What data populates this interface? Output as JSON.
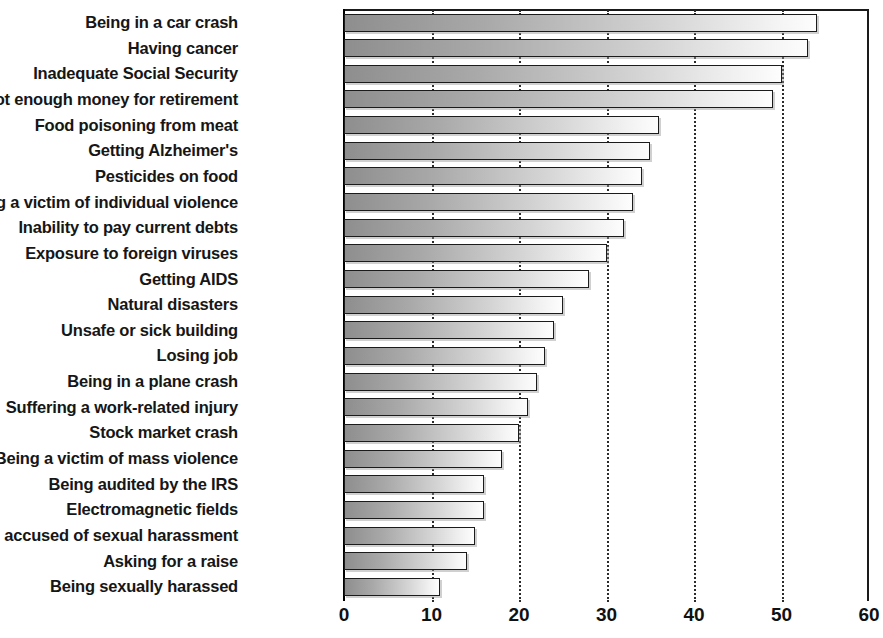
{
  "chart_data": {
    "type": "bar",
    "orientation": "horizontal",
    "title": "",
    "xlabel": "",
    "ylabel": "",
    "xlim": [
      0,
      60
    ],
    "xticks": [
      0,
      10,
      20,
      30,
      40,
      50,
      60
    ],
    "grid": true,
    "grid_axis": "x",
    "gridline_style": "dotted",
    "legend": "none",
    "categories": [
      "Being in a car crash",
      "Having cancer",
      "Inadequate Social Security",
      "Not enough money for retirement",
      "Food poisoning from meat",
      "Getting Alzheimer's",
      "Pesticides on food",
      "Being a victim of individual violence",
      "Inability to pay current debts",
      "Exposure to foreign viruses",
      "Getting AIDS",
      "Natural disasters",
      "Unsafe or sick building",
      "Losing job",
      "Being in a plane crash",
      "Suffering a work-related injury",
      "Stock market crash",
      "Being a victim of mass violence",
      "Being audited by the IRS",
      "Electromagnetic fields",
      "Being accused of sexual harassment",
      "Asking for a raise",
      "Being sexually harassed"
    ],
    "values": [
      54,
      53,
      50,
      49,
      36,
      35,
      34,
      33,
      32,
      30,
      28,
      25,
      24,
      23,
      22,
      21,
      20,
      18,
      16,
      16,
      15,
      14,
      11
    ]
  },
  "style": {
    "bar_fill_start": "#8e8e8e",
    "bar_fill_end": "#fdfdfd",
    "bar_border": "#1b1b1b",
    "axis_color": "#111111",
    "grid_color": "#2b2b2b",
    "text_color": "#161616",
    "background": "#ffffff"
  }
}
